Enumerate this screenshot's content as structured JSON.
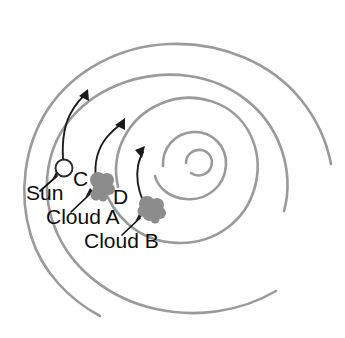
{
  "figure": {
    "type": "spiral-galaxy-diagram",
    "background_color": "#ffffff",
    "arm_color": "#9a9a9a",
    "cloud_color": "#8c8c8c",
    "sun_fill_color": "#ffffff",
    "sun_outline_color": "#2a2a2a",
    "arrow_color": "#1b1b1b",
    "label_color": "#0d0d0d"
  },
  "labels": {
    "sun": "Sun",
    "arm_c": "C",
    "arm_d": "D",
    "cloud_a": "Cloud A",
    "cloud_b": "Cloud B"
  },
  "objects": [
    {
      "name": "Sun",
      "kind": "star",
      "x": 64,
      "y": 168
    },
    {
      "name": "Cloud A",
      "kind": "gas-cloud",
      "x": 101,
      "y": 186
    },
    {
      "name": "Cloud B",
      "kind": "gas-cloud",
      "x": 151,
      "y": 209
    }
  ],
  "spiral_arms": [
    {
      "id": "C",
      "label": "C"
    },
    {
      "id": "D",
      "label": "D"
    }
  ],
  "motion_arrows": [
    {
      "from": "Sun",
      "direction": "counterclockwise-orbital"
    },
    {
      "from": "Cloud A",
      "direction": "counterclockwise-orbital"
    },
    {
      "from": "Cloud B",
      "direction": "counterclockwise-orbital"
    }
  ]
}
